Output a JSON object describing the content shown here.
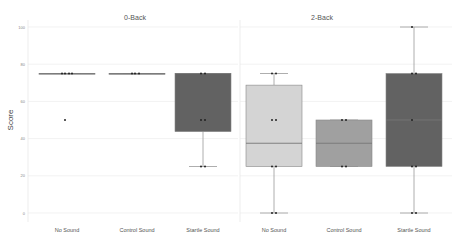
{
  "chart_data": {
    "type": "box",
    "ylabel": "Score",
    "ylim": [
      0,
      100
    ],
    "yticks": [
      0,
      20,
      40,
      60,
      80,
      100
    ],
    "grid": true,
    "legend": "none",
    "panels": [
      {
        "title": "0-Back",
        "categories": [
          "No Sound",
          "Control Sound",
          "Startle Sound"
        ],
        "boxes": [
          {
            "category": "No Sound",
            "min": 75,
            "q1": 75,
            "median": 75,
            "q3": 75,
            "max": 75,
            "outliers": [
              50
            ],
            "color": "#d4d4d4",
            "points": [
              75,
              75,
              75,
              75,
              50
            ]
          },
          {
            "category": "Control Sound",
            "min": 75,
            "q1": 75,
            "median": 75,
            "q3": 75,
            "max": 75,
            "outliers": [],
            "color": "#a0a0a0",
            "points": [
              75,
              75,
              75
            ]
          },
          {
            "category": "Startle Sound",
            "min": 25,
            "q1": 43.75,
            "median": 75,
            "q3": 75,
            "max": 75,
            "outliers": [],
            "color": "#626262",
            "points": [
              75,
              75,
              50,
              50,
              25,
              25
            ]
          }
        ]
      },
      {
        "title": "2-Back",
        "categories": [
          "No Sound",
          "Control Sound",
          "Startle Sound"
        ],
        "boxes": [
          {
            "category": "No Sound",
            "min": 0,
            "q1": 25,
            "median": 37.5,
            "q3": 68.75,
            "max": 75,
            "outliers": [],
            "color": "#d4d4d4",
            "points": [
              75,
              75,
              50,
              50,
              25,
              25,
              0,
              0
            ]
          },
          {
            "category": "Control Sound",
            "min": 25,
            "q1": 25,
            "median": 37.5,
            "q3": 50,
            "max": 50,
            "outliers": [],
            "color": "#a0a0a0",
            "points": [
              50,
              50,
              25,
              25
            ]
          },
          {
            "category": "Startle Sound",
            "min": 0,
            "q1": 25,
            "median": 50,
            "q3": 75,
            "max": 100,
            "outliers": [],
            "color": "#626262",
            "points": [
              100,
              75,
              75,
              50,
              25,
              25,
              0,
              0
            ]
          }
        ]
      }
    ]
  }
}
